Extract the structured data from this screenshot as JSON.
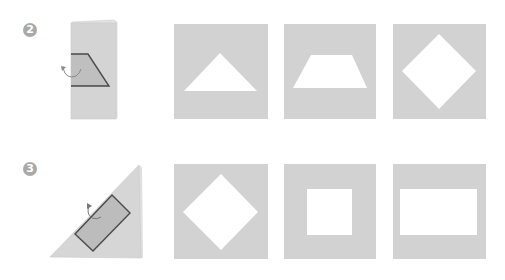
{
  "steps": [
    {
      "number": "2",
      "fold_diagram": {
        "paper": "folded-rectangle",
        "cut_shape": "trapezoid",
        "rotation_arrow": "curved-arrow"
      },
      "results": [
        {
          "shape": "triangle"
        },
        {
          "shape": "trapezoid"
        },
        {
          "shape": "diamond"
        }
      ]
    },
    {
      "number": "3",
      "fold_diagram": {
        "paper": "folded-triangle",
        "cut_shape": "rectangle",
        "rotation_arrow": "curved-arrow"
      },
      "results": [
        {
          "shape": "diamond"
        },
        {
          "shape": "square"
        },
        {
          "shape": "rectangle"
        }
      ]
    }
  ],
  "colors": {
    "paper": "#d2d2d2",
    "paper_light": "#dcdcdc",
    "cut_region": "#bdbdbd",
    "outline": "#555555",
    "cutout": "#ffffff",
    "badge": "#a9a9a9"
  }
}
